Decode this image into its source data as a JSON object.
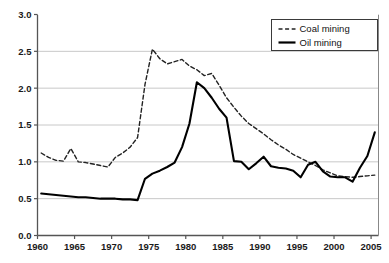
{
  "chart_data": {
    "type": "line",
    "title": "",
    "subtitle": "",
    "xlabel": "",
    "ylabel": "",
    "xlim": [
      1960,
      2006
    ],
    "ylim": [
      0.0,
      3.0
    ],
    "grid": "horizontal",
    "legend_position": "top-right",
    "xticks": [
      "1960",
      "1965",
      "1970",
      "1975",
      "1980",
      "1985",
      "1990",
      "1995",
      "2000",
      "2005"
    ],
    "xtick_values": [
      1960,
      1965,
      1970,
      1975,
      1980,
      1985,
      1990,
      1995,
      2000,
      2005
    ],
    "yticks": [
      "0.0",
      "0.5",
      "1.0",
      "1.5",
      "2.0",
      "2.5",
      "3.0"
    ],
    "ytick_values": [
      0.0,
      0.5,
      1.0,
      1.5,
      2.0,
      2.5,
      3.0
    ],
    "series": [
      {
        "name": "Coal mining",
        "style": "dashed",
        "color": "#222222",
        "x": [
          1960.5,
          1961.5,
          1962.5,
          1963.5,
          1964.5,
          1965.5,
          1966.5,
          1967.5,
          1968.5,
          1969.5,
          1970.5,
          1971.5,
          1972.5,
          1973.5,
          1974.5,
          1975.5,
          1976.5,
          1977.5,
          1978.5,
          1979.5,
          1980.5,
          1981.5,
          1982.5,
          1983.5,
          1984.5,
          1985.5,
          1986.5,
          1987.5,
          1988.5,
          1989.5,
          1990.5,
          1991.5,
          1992.5,
          1993.5,
          1994.5,
          1995.5,
          1996.5,
          1997.5,
          1998.5,
          1999.5,
          2000.5,
          2001.5,
          2002.5,
          2003.5,
          2004.5,
          2005.5
        ],
        "values": [
          1.12,
          1.06,
          1.02,
          1.01,
          1.18,
          1.0,
          0.99,
          0.97,
          0.95,
          0.93,
          1.06,
          1.12,
          1.2,
          1.33,
          2.05,
          2.53,
          2.4,
          2.33,
          2.36,
          2.39,
          2.3,
          2.25,
          2.17,
          2.2,
          2.04,
          1.87,
          1.74,
          1.62,
          1.52,
          1.45,
          1.38,
          1.3,
          1.23,
          1.17,
          1.1,
          1.05,
          1.0,
          0.95,
          0.89,
          0.85,
          0.81,
          0.8,
          0.79,
          0.8,
          0.81,
          0.82
        ]
      },
      {
        "name": "Oil mining",
        "style": "solid",
        "color": "#000000",
        "x": [
          1960.5,
          1961.5,
          1962.5,
          1963.5,
          1964.5,
          1965.5,
          1966.5,
          1967.5,
          1968.5,
          1969.5,
          1970.5,
          1971.5,
          1972.5,
          1973.5,
          1974.5,
          1975.5,
          1976.5,
          1977.5,
          1978.5,
          1979.5,
          1980.5,
          1981.5,
          1982.5,
          1983.5,
          1984.5,
          1985.5,
          1986.5,
          1987.5,
          1988.5,
          1989.5,
          1990.5,
          1991.5,
          1992.5,
          1993.5,
          1994.5,
          1995.5,
          1996.5,
          1997.5,
          1998.5,
          1999.5,
          2000.5,
          2001.5,
          2002.5,
          2003.5,
          2004.5,
          2005.5
        ],
        "values": [
          0.57,
          0.56,
          0.55,
          0.54,
          0.53,
          0.52,
          0.52,
          0.51,
          0.5,
          0.5,
          0.5,
          0.49,
          0.49,
          0.48,
          0.77,
          0.84,
          0.88,
          0.93,
          0.99,
          1.2,
          1.52,
          2.08,
          2.0,
          1.87,
          1.72,
          1.6,
          1.01,
          1.0,
          0.9,
          0.98,
          1.07,
          0.94,
          0.92,
          0.91,
          0.88,
          0.79,
          0.96,
          1.0,
          0.87,
          0.8,
          0.79,
          0.79,
          0.73,
          0.92,
          1.08,
          1.4
        ]
      }
    ]
  }
}
